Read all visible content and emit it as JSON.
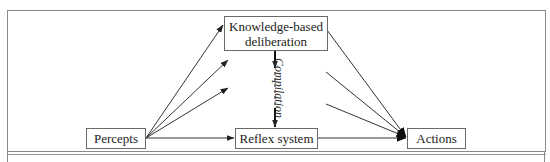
{
  "diagram": {
    "nodes": {
      "knowledge": {
        "label_line1": "Knowledge-based",
        "label_line2": "deliberation"
      },
      "percepts": {
        "label": "Percepts"
      },
      "reflex": {
        "label": "Reflex system"
      },
      "actions": {
        "label": "Actions"
      }
    },
    "edge_labels": {
      "compilation": "Compilation"
    },
    "edges": [
      {
        "from": "Percepts",
        "to": "Knowledge-based deliberation",
        "style": "solid"
      },
      {
        "from": "Percepts",
        "to": "(unlabeled)",
        "style": "solid"
      },
      {
        "from": "Percepts",
        "to": "(unlabeled)",
        "style": "solid"
      },
      {
        "from": "Percepts",
        "to": "Reflex system",
        "style": "solid"
      },
      {
        "from": "Knowledge-based deliberation",
        "to": "Reflex system",
        "style": "dashed",
        "label": "Compilation"
      },
      {
        "from": "Knowledge-based deliberation",
        "to": "Actions",
        "style": "solid"
      },
      {
        "from": "(unlabeled)",
        "to": "Actions",
        "style": "solid"
      },
      {
        "from": "(unlabeled)",
        "to": "Actions",
        "style": "solid"
      },
      {
        "from": "Reflex system",
        "to": "Actions",
        "style": "solid"
      }
    ],
    "colors": {
      "line": "#333333",
      "frame": "#8a8a8a",
      "box_border": "#6a6a6a"
    }
  }
}
